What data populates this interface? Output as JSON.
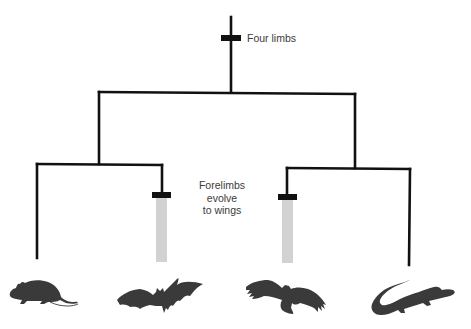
{
  "diagram": {
    "type": "cladogram",
    "colors": {
      "line": "#111111",
      "trait_bar": "#111111",
      "wing_bar": "#d2d2d2",
      "silhouette": "#3a3a3a",
      "label_text": "#3a3a3a"
    },
    "traits": [
      {
        "id": "four-limbs",
        "label": "Four limbs"
      },
      {
        "id": "wings",
        "label_lines": [
          "Forelimbs",
          "evolve",
          "to wings"
        ]
      }
    ],
    "taxa": [
      {
        "id": "mouse",
        "name": "mouse",
        "icon": "mouse-silhouette",
        "has_wings": false
      },
      {
        "id": "bat",
        "name": "bat",
        "icon": "bat-silhouette",
        "has_wings": true
      },
      {
        "id": "bird",
        "name": "bird",
        "icon": "bird-silhouette",
        "has_wings": true
      },
      {
        "id": "crocodile",
        "name": "crocodile",
        "icon": "crocodile-silhouette",
        "has_wings": false
      }
    ],
    "tree": {
      "root": {
        "trait": "four-limbs",
        "children": [
          {
            "children": [
              "mouse",
              "bat"
            ]
          },
          {
            "children": [
              "bird",
              "crocodile"
            ]
          }
        ]
      }
    }
  }
}
